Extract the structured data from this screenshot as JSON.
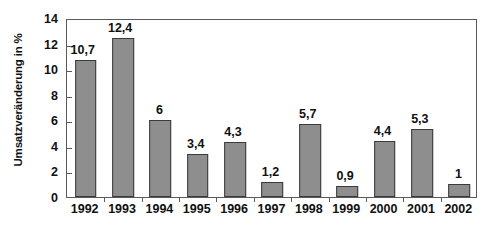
{
  "chart_data": {
    "type": "bar",
    "title": "",
    "subtitle": "",
    "xlabel": "",
    "ylabel": "Umsatzveränderung in %",
    "categories": [
      "1992",
      "1993",
      "1994",
      "1995",
      "1996",
      "1997",
      "1998",
      "1999",
      "2000",
      "2001",
      "2002"
    ],
    "values": [
      10.7,
      12.4,
      6,
      3.4,
      4.3,
      1.2,
      5.7,
      0.9,
      4.4,
      5.3,
      1
    ],
    "value_labels": [
      "10,7",
      "12,4",
      "6",
      "3,4",
      "4,3",
      "1,2",
      "5,7",
      "0,9",
      "4,4",
      "5,3",
      "1"
    ],
    "ylim": [
      0,
      14
    ],
    "ytick_values": [
      0,
      2,
      4,
      6,
      8,
      10,
      12,
      14
    ],
    "ytick_labels": [
      "0",
      "2",
      "4",
      "6",
      "8",
      "10",
      "12",
      "14"
    ],
    "grid": false,
    "legend": null,
    "legend_position": "none",
    "bar_color": "#8e8e8e",
    "bar_border_color": "#3a3a3a",
    "axis_color": "#5a5a5a",
    "text_color": "#101010",
    "background_color": "#ffffff",
    "decimal_separator": ","
  }
}
